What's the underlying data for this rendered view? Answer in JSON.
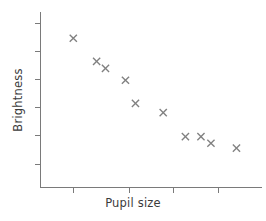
{
  "chart_data": {
    "type": "scatter",
    "title": "",
    "xlabel": "Pupil size",
    "ylabel": "Brightness",
    "marker": "x",
    "marker_color": "#808080",
    "axis_color": "#7a7a7a",
    "background": "#ffffff",
    "grid": false,
    "legend": null,
    "xlim": [
      0,
      10
    ],
    "ylim": [
      0,
      10
    ],
    "x_tick_labels": [],
    "y_tick_labels": [],
    "x_ticks": [
      1.5,
      4.0,
      6.0,
      8.0
    ],
    "y_ticks": [
      1.3,
      3.0,
      4.6,
      6.2,
      7.8,
      9.4
    ],
    "points": [
      {
        "x": 1.5,
        "y": 8.5
      },
      {
        "x": 2.55,
        "y": 7.18
      },
      {
        "x": 2.95,
        "y": 6.78
      },
      {
        "x": 3.85,
        "y": 6.1
      },
      {
        "x": 4.3,
        "y": 4.78
      },
      {
        "x": 5.55,
        "y": 4.25
      },
      {
        "x": 6.55,
        "y": 2.88
      },
      {
        "x": 7.25,
        "y": 2.88
      },
      {
        "x": 7.7,
        "y": 2.5
      },
      {
        "x": 8.85,
        "y": 2.22
      }
    ],
    "n_points": 10,
    "trend": "decreasing"
  },
  "axes": {
    "x_label": "Pupil size",
    "y_label": "Brightness"
  },
  "geometry": {
    "width": 266,
    "height": 221,
    "plot_left": 40,
    "plot_right": 262,
    "plot_top": 12,
    "plot_bottom": 187
  }
}
